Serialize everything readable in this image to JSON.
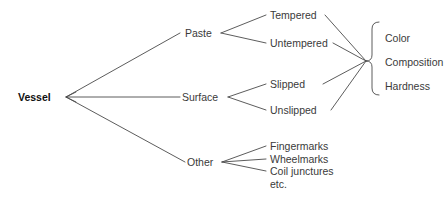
{
  "diagram": {
    "type": "tree",
    "title": "",
    "root": {
      "label": "Vessel"
    },
    "branches": [
      {
        "label": "Paste",
        "children": [
          {
            "label": "Tempered"
          },
          {
            "label": "Untempered"
          }
        ]
      },
      {
        "label": "Surface",
        "children": [
          {
            "label": "Slipped"
          },
          {
            "label": "Unslipped"
          }
        ]
      },
      {
        "label": "Other",
        "children": [
          {
            "label": "Fingermarks"
          },
          {
            "label": "Wheelmarks"
          },
          {
            "label": "Coil junctures"
          },
          {
            "label": "etc."
          }
        ]
      }
    ],
    "grouped_attributes": {
      "bracket": "curly-brace",
      "items": [
        {
          "label": "Color"
        },
        {
          "label": "Composition"
        },
        {
          "label": "Hardness"
        }
      ]
    },
    "colors": {
      "line": "#4a4a4a",
      "text": "#3a3a3a",
      "root_text": "#111111",
      "background": "#ffffff"
    }
  }
}
